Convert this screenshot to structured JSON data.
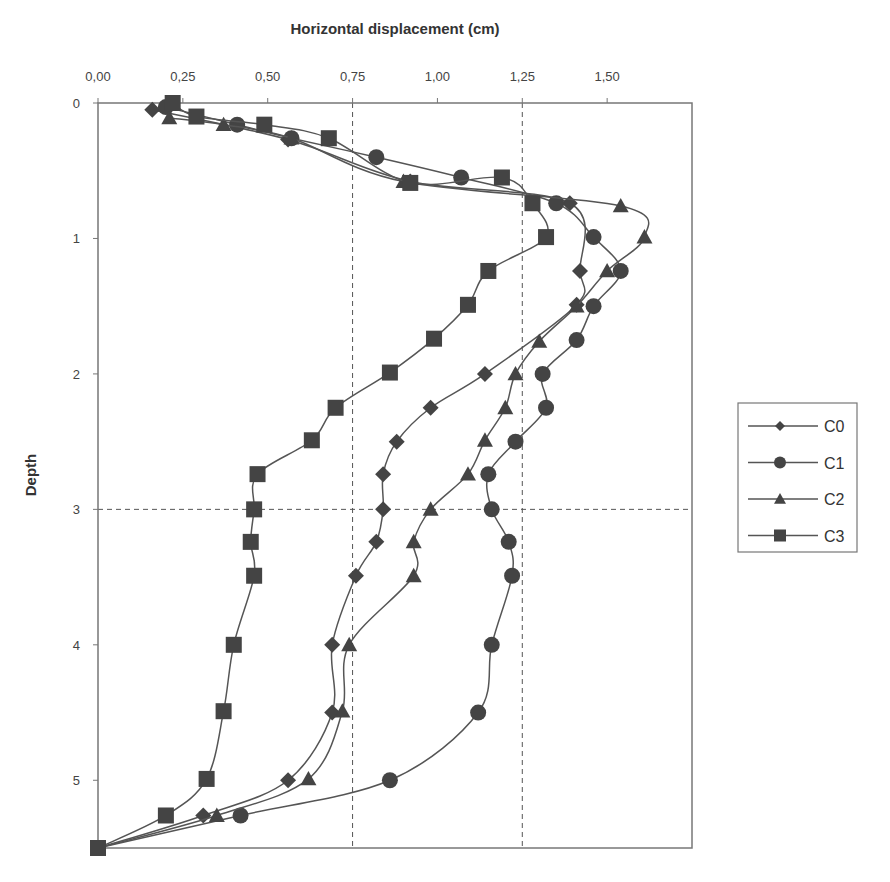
{
  "chart_data": {
    "type": "line",
    "title": "Horizontal displacement (cm)",
    "xlabel": "Horizontal displacement (cm)",
    "ylabel": "Depth",
    "xlim": [
      0,
      1.75
    ],
    "ylim": [
      5.5,
      0
    ],
    "x_axis_position": "top",
    "y_inverted": true,
    "x_ticks": [
      "0,00",
      "0,25",
      "0,50",
      "0,75",
      "1,00",
      "1,25",
      "1,50"
    ],
    "x_tick_values": [
      0,
      0.25,
      0.5,
      0.75,
      1.0,
      1.25,
      1.5
    ],
    "y_ticks": [
      "0",
      "1",
      "2",
      "3",
      "4",
      "5"
    ],
    "y_tick_values": [
      0,
      1,
      2,
      3,
      4,
      5
    ],
    "reference_lines": {
      "vertical_dashed": [
        0.75,
        1.25
      ],
      "horizontal_dashed": [
        3
      ]
    },
    "legend_position": "right",
    "series": [
      {
        "name": "C0",
        "marker": "diamond",
        "points": [
          [
            0.16,
            0.05
          ],
          [
            0.56,
            0.27
          ],
          [
            0.92,
            0.58
          ],
          [
            1.39,
            0.74
          ],
          [
            1.42,
            1.24
          ],
          [
            1.41,
            1.49
          ],
          [
            1.14,
            2.0
          ],
          [
            0.98,
            2.25
          ],
          [
            0.88,
            2.5
          ],
          [
            0.84,
            2.74
          ],
          [
            0.84,
            3.0
          ],
          [
            0.82,
            3.24
          ],
          [
            0.76,
            3.49
          ],
          [
            0.69,
            4.0
          ],
          [
            0.69,
            4.5
          ],
          [
            0.56,
            5.0
          ],
          [
            0.31,
            5.26
          ],
          [
            0.0,
            5.5
          ]
        ]
      },
      {
        "name": "C1",
        "marker": "circle",
        "points": [
          [
            0.2,
            0.03
          ],
          [
            0.41,
            0.16
          ],
          [
            0.57,
            0.26
          ],
          [
            0.82,
            0.4
          ],
          [
            1.07,
            0.55
          ],
          [
            1.35,
            0.74
          ],
          [
            1.46,
            0.99
          ],
          [
            1.54,
            1.24
          ],
          [
            1.46,
            1.5
          ],
          [
            1.41,
            1.75
          ],
          [
            1.31,
            2.0
          ],
          [
            1.32,
            2.25
          ],
          [
            1.23,
            2.5
          ],
          [
            1.15,
            2.74
          ],
          [
            1.16,
            3.0
          ],
          [
            1.21,
            3.24
          ],
          [
            1.22,
            3.49
          ],
          [
            1.16,
            4.0
          ],
          [
            1.12,
            4.5
          ],
          [
            0.86,
            5.0
          ],
          [
            0.42,
            5.26
          ],
          [
            0.0,
            5.5
          ]
        ]
      },
      {
        "name": "C2",
        "marker": "triangle",
        "points": [
          [
            0.21,
            0.11
          ],
          [
            0.37,
            0.16
          ],
          [
            0.57,
            0.26
          ],
          [
            0.9,
            0.58
          ],
          [
            1.54,
            0.76
          ],
          [
            1.61,
            0.99
          ],
          [
            1.5,
            1.24
          ],
          [
            1.41,
            1.5
          ],
          [
            1.3,
            1.76
          ],
          [
            1.23,
            2.0
          ],
          [
            1.2,
            2.25
          ],
          [
            1.14,
            2.49
          ],
          [
            1.09,
            2.74
          ],
          [
            0.98,
            3.0
          ],
          [
            0.93,
            3.24
          ],
          [
            0.93,
            3.49
          ],
          [
            0.74,
            4.0
          ],
          [
            0.72,
            4.49
          ],
          [
            0.62,
            4.99
          ],
          [
            0.35,
            5.26
          ],
          [
            0.0,
            5.5
          ]
        ]
      },
      {
        "name": "C3",
        "marker": "square",
        "points": [
          [
            0.22,
            0.0
          ],
          [
            0.29,
            0.1
          ],
          [
            0.49,
            0.16
          ],
          [
            0.68,
            0.26
          ],
          [
            0.92,
            0.59
          ],
          [
            1.19,
            0.55
          ],
          [
            1.28,
            0.74
          ],
          [
            1.32,
            0.99
          ],
          [
            1.15,
            1.24
          ],
          [
            1.09,
            1.49
          ],
          [
            0.99,
            1.74
          ],
          [
            0.86,
            1.99
          ],
          [
            0.7,
            2.25
          ],
          [
            0.63,
            2.49
          ],
          [
            0.47,
            2.74
          ],
          [
            0.46,
            3.0
          ],
          [
            0.45,
            3.24
          ],
          [
            0.46,
            3.49
          ],
          [
            0.4,
            4.0
          ],
          [
            0.37,
            4.49
          ],
          [
            0.32,
            4.99
          ],
          [
            0.2,
            5.26
          ],
          [
            0.0,
            5.5
          ]
        ]
      }
    ]
  },
  "style": {
    "line_color": "#555555",
    "marker_color": "#444444",
    "axis_color": "#777777",
    "grid_dash_color": "#555555"
  }
}
